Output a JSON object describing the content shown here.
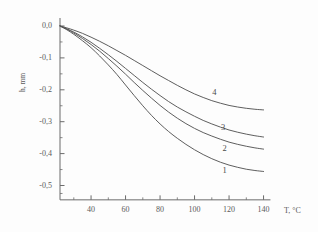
{
  "chart_data": {
    "type": "line",
    "title": "",
    "xlabel": "T, °C",
    "ylabel": "h, mm",
    "xlim": [
      20,
      145
    ],
    "ylim": [
      -0.55,
      0.03
    ],
    "grid": false,
    "legend_position": "inline-curve-labels",
    "x_ticks": [
      40,
      60,
      80,
      100,
      120,
      140
    ],
    "x_tick_labels": [
      "40",
      "60",
      "80",
      "100",
      "120",
      "140"
    ],
    "x_minor_tick_step": 10,
    "y_ticks": [
      0.0,
      -0.1,
      -0.2,
      -0.3,
      -0.4,
      -0.5
    ],
    "y_tick_labels": [
      "0,0",
      "-0,1",
      "-0,2",
      "-0,3",
      "-0,4",
      "-0,5"
    ],
    "y_minor_tick_step": 0.05,
    "line_color": "#555555",
    "series": [
      {
        "name": "1",
        "label": "1",
        "label_x": 118,
        "label_y": -0.452,
        "x": [
          22,
          26,
          30,
          35,
          40,
          45,
          50,
          55,
          60,
          65,
          70,
          75,
          80,
          85,
          90,
          95,
          100,
          105,
          110,
          115,
          120,
          125,
          130,
          135,
          140
        ],
        "y": [
          0.0,
          -0.012,
          -0.026,
          -0.046,
          -0.068,
          -0.094,
          -0.122,
          -0.152,
          -0.185,
          -0.218,
          -0.25,
          -0.28,
          -0.307,
          -0.331,
          -0.352,
          -0.371,
          -0.388,
          -0.403,
          -0.416,
          -0.427,
          -0.436,
          -0.443,
          -0.449,
          -0.453,
          -0.456
        ]
      },
      {
        "name": "2",
        "label": "2",
        "label_x": 118,
        "label_y": -0.382,
        "x": [
          22,
          26,
          30,
          35,
          40,
          45,
          50,
          55,
          60,
          65,
          70,
          75,
          80,
          85,
          90,
          95,
          100,
          105,
          110,
          115,
          120,
          125,
          130,
          135,
          140
        ],
        "y": [
          0.0,
          -0.01,
          -0.022,
          -0.039,
          -0.058,
          -0.079,
          -0.102,
          -0.126,
          -0.151,
          -0.177,
          -0.202,
          -0.226,
          -0.249,
          -0.27,
          -0.289,
          -0.306,
          -0.321,
          -0.334,
          -0.345,
          -0.355,
          -0.364,
          -0.371,
          -0.377,
          -0.382,
          -0.386
        ]
      },
      {
        "name": "3",
        "label": "3",
        "label_x": 117,
        "label_y": -0.317,
        "x": [
          22,
          26,
          30,
          35,
          40,
          45,
          50,
          55,
          60,
          65,
          70,
          75,
          80,
          85,
          90,
          95,
          100,
          105,
          110,
          115,
          120,
          125,
          130,
          135,
          140
        ],
        "y": [
          0.0,
          -0.009,
          -0.019,
          -0.034,
          -0.051,
          -0.07,
          -0.09,
          -0.111,
          -0.133,
          -0.155,
          -0.177,
          -0.198,
          -0.218,
          -0.237,
          -0.254,
          -0.269,
          -0.283,
          -0.296,
          -0.307,
          -0.317,
          -0.326,
          -0.333,
          -0.339,
          -0.344,
          -0.348
        ]
      },
      {
        "name": "4",
        "label": "4",
        "label_x": 112,
        "label_y": -0.207,
        "x": [
          22,
          26,
          30,
          35,
          40,
          45,
          50,
          55,
          60,
          65,
          70,
          75,
          80,
          85,
          90,
          95,
          100,
          105,
          110,
          115,
          120,
          125,
          130,
          135,
          140
        ],
        "y": [
          0.0,
          -0.006,
          -0.013,
          -0.023,
          -0.035,
          -0.048,
          -0.062,
          -0.077,
          -0.092,
          -0.108,
          -0.124,
          -0.14,
          -0.156,
          -0.171,
          -0.186,
          -0.2,
          -0.213,
          -0.224,
          -0.234,
          -0.242,
          -0.249,
          -0.254,
          -0.258,
          -0.261,
          -0.263
        ]
      }
    ]
  }
}
